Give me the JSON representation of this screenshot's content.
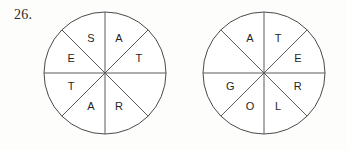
{
  "exercise": {
    "number": "26."
  },
  "wheels": [
    {
      "name": "word-wheel-left",
      "center": {
        "x": 62,
        "y": 62
      },
      "radius": 61,
      "sector_count": 8,
      "sectors": [
        {
          "position": "north-east",
          "angle_deg": 22.5,
          "letter": "A"
        },
        {
          "position": "east-north",
          "angle_deg": 67.5,
          "letter": "T"
        },
        {
          "position": "east-south",
          "angle_deg": 112.5,
          "letter": ""
        },
        {
          "position": "south-east",
          "angle_deg": 157.5,
          "letter": "R"
        },
        {
          "position": "south-west",
          "angle_deg": 202.5,
          "letter": "A"
        },
        {
          "position": "west-south",
          "angle_deg": 247.5,
          "letter": "T"
        },
        {
          "position": "west-north",
          "angle_deg": 292.5,
          "letter": "E"
        },
        {
          "position": "north-west",
          "angle_deg": 337.5,
          "letter": "S"
        }
      ]
    },
    {
      "name": "word-wheel-right",
      "center": {
        "x": 62,
        "y": 62
      },
      "radius": 61,
      "sector_count": 8,
      "sectors": [
        {
          "position": "north-east",
          "angle_deg": 22.5,
          "letter": "T"
        },
        {
          "position": "east-north",
          "angle_deg": 67.5,
          "letter": "E"
        },
        {
          "position": "east-south",
          "angle_deg": 112.5,
          "letter": "R"
        },
        {
          "position": "south-east",
          "angle_deg": 157.5,
          "letter": "L"
        },
        {
          "position": "south-west",
          "angle_deg": 202.5,
          "letter": "O"
        },
        {
          "position": "west-south",
          "angle_deg": 247.5,
          "letter": "G"
        },
        {
          "position": "west-north",
          "angle_deg": 292.5,
          "letter": ""
        },
        {
          "position": "north-west",
          "angle_deg": 337.5,
          "letter": "A"
        }
      ]
    }
  ],
  "colors": {
    "page_background": "#fdfdfc",
    "circle_fill": "#ffffff",
    "circle_stroke": "#4a4a4a",
    "divider_stroke": "#5a5a5a",
    "letter_color": "#1f1f1f",
    "number_color": "#2b2b2b"
  }
}
